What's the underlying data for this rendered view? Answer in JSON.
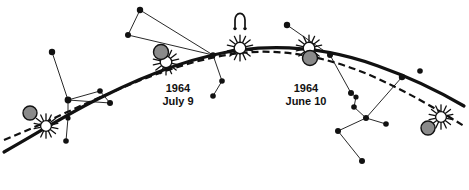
{
  "figure": {
    "kind": "astronomical-diagram",
    "background_color": "#ffffff",
    "ink_color": "#111111",
    "moon_disc_color": "#8a8a8a",
    "moon_disc_stroke": "#111111"
  },
  "labels": [
    {
      "id": "eclipse-july",
      "year": "1964",
      "date": "July 9",
      "x": 178,
      "y": 92,
      "line_height": 13
    },
    {
      "id": "eclipse-june",
      "year": "1964",
      "date": "June 10",
      "x": 306,
      "y": 92,
      "line_height": 13
    }
  ],
  "node_symbol": {
    "name": "ascending-node",
    "glyph": "☊",
    "x": 240,
    "y": 20
  },
  "paths": {
    "ecliptic": {
      "name": "sun-path-ecliptic",
      "style": "solid",
      "stroke_width": 3.2,
      "d": "M 4,152 C 40,132 70,112 104,96 C 150,73 196,56 240,50 C 288,44 334,50 378,66 C 412,78 440,92 464,106"
    },
    "moon_path": {
      "name": "moon-path",
      "style": "dashed",
      "stroke_width": 2.2,
      "dash": "7 4",
      "d": "M 4,140 C 44,124 74,108 108,94 C 152,74 198,58 240,53 C 286,48 330,58 372,76 C 408,92 438,110 464,126"
    }
  },
  "eclipses": [
    {
      "id": "far-left",
      "name": "eclipse-far-left",
      "sun_x": 46,
      "sun_y": 126,
      "moon_x": 30,
      "moon_y": 113,
      "sun_r": 7.5,
      "moon_r": 7.0,
      "order": "moon-behind"
    },
    {
      "id": "july-9",
      "name": "eclipse-july-9",
      "sun_x": 166,
      "sun_y": 62,
      "moon_x": 161,
      "moon_y": 52,
      "sun_r": 8.0,
      "moon_r": 7.5,
      "order": "moon-front"
    },
    {
      "id": "node",
      "name": "eclipse-node",
      "sun_x": 240,
      "sun_y": 48,
      "moon_x": 240,
      "moon_y": 48,
      "sun_r": 8.0,
      "moon_r": 0.0,
      "order": "sun-only"
    },
    {
      "id": "june-10",
      "name": "eclipse-june-10",
      "sun_x": 309,
      "sun_y": 48,
      "moon_x": 310,
      "moon_y": 58,
      "sun_r": 8.0,
      "moon_r": 7.5,
      "order": "moon-front"
    },
    {
      "id": "far-right",
      "name": "eclipse-far-right",
      "sun_x": 441,
      "sun_y": 117,
      "moon_x": 428,
      "moon_y": 128,
      "sun_r": 7.5,
      "moon_r": 7.0,
      "order": "moon-front"
    }
  ],
  "stars": [
    {
      "id": "s1",
      "x": 52,
      "y": 52,
      "r": 3.2
    },
    {
      "id": "s2",
      "x": 68,
      "y": 100,
      "r": 3.4
    },
    {
      "id": "s3",
      "x": 100,
      "y": 91,
      "r": 2.8
    },
    {
      "id": "s4",
      "x": 68,
      "y": 118,
      "r": 2.6
    },
    {
      "id": "s5",
      "x": 66,
      "y": 141,
      "r": 2.8
    },
    {
      "id": "s6",
      "x": 110,
      "y": 103,
      "r": 3.0
    },
    {
      "id": "s7",
      "x": 140,
      "y": 10,
      "r": 3.2
    },
    {
      "id": "s8",
      "x": 128,
      "y": 35,
      "r": 3.0
    },
    {
      "id": "s9",
      "x": 213,
      "y": 55,
      "r": 2.8
    },
    {
      "id": "s10",
      "x": 222,
      "y": 81,
      "r": 2.8
    },
    {
      "id": "s11",
      "x": 213,
      "y": 96,
      "r": 2.8
    },
    {
      "id": "s12",
      "x": 287,
      "y": 25,
      "r": 3.2
    },
    {
      "id": "s13",
      "x": 330,
      "y": 55,
      "r": 3.0
    },
    {
      "id": "s14",
      "x": 351,
      "y": 93,
      "r": 3.0
    },
    {
      "id": "s15",
      "x": 356,
      "y": 97,
      "r": 2.6
    },
    {
      "id": "s16",
      "x": 354,
      "y": 107,
      "r": 2.8
    },
    {
      "id": "s17",
      "x": 366,
      "y": 118,
      "r": 3.0
    },
    {
      "id": "s18",
      "x": 402,
      "y": 77,
      "r": 3.2
    },
    {
      "id": "s19",
      "x": 386,
      "y": 124,
      "r": 2.8
    },
    {
      "id": "s20",
      "x": 338,
      "y": 131,
      "r": 3.0
    },
    {
      "id": "s21",
      "x": 362,
      "y": 161,
      "r": 3.0
    },
    {
      "id": "s22",
      "x": 420,
      "y": 71,
      "r": 2.8
    }
  ],
  "constellation_lines": [
    {
      "from": "s1",
      "to": "s2"
    },
    {
      "from": "s2",
      "to": "s3"
    },
    {
      "from": "s2",
      "to": "s4"
    },
    {
      "from": "s4",
      "to": "s5"
    },
    {
      "from": "s2",
      "to": "s6"
    },
    {
      "from": "s3",
      "to": "s6"
    },
    {
      "from": "s7",
      "to": "s8"
    },
    {
      "from": "s8",
      "to": "s9"
    },
    {
      "from": "s7",
      "to": "s9"
    },
    {
      "from": "s9",
      "to": "s10"
    },
    {
      "from": "s10",
      "to": "s11"
    },
    {
      "from": "s12",
      "to": "s13"
    },
    {
      "from": "s13",
      "to": "s14"
    },
    {
      "from": "s14",
      "to": "s15"
    },
    {
      "from": "s15",
      "to": "s16"
    },
    {
      "from": "s16",
      "to": "s17"
    },
    {
      "from": "s17",
      "to": "s18"
    },
    {
      "from": "s17",
      "to": "s19"
    },
    {
      "from": "s17",
      "to": "s20"
    },
    {
      "from": "s20",
      "to": "s21"
    }
  ]
}
